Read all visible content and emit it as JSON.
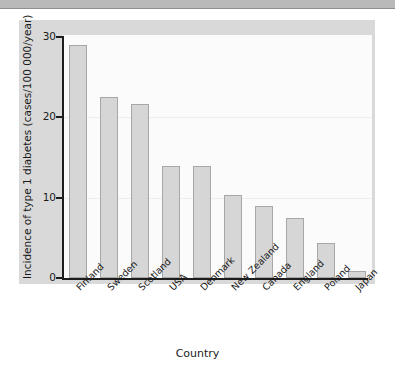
{
  "chart_data": {
    "type": "bar",
    "title": "",
    "xlabel": "Country",
    "ylabel": "Incidence of type 1 diabetes (cases/100 000/year)",
    "categories": [
      "Finland",
      "Sweden",
      "Scotland",
      "USA",
      "Denmark",
      "New Zealand",
      "Canada",
      "England",
      "Poland",
      "Japan"
    ],
    "values": [
      29,
      22.5,
      21.7,
      14,
      14,
      10.3,
      9,
      7.5,
      4.3,
      0.9
    ],
    "ylim": [
      0,
      30
    ],
    "yticks": [
      0,
      10,
      20,
      30
    ],
    "ytick_labels": [
      "0",
      "10",
      "20",
      "30"
    ],
    "grid": false,
    "legend": "none",
    "bar_color": "#d6d6d6",
    "bar_border_color": "#a7a7a7",
    "axis_color": "#1d1d1d",
    "panel_color": "#d9d9d9",
    "plot_background": "#fbfbfb"
  }
}
